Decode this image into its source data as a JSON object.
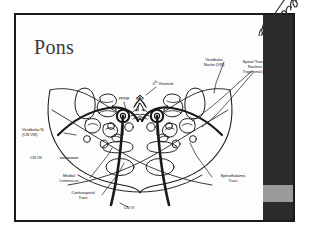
{
  "slide": {
    "title": "Pons",
    "watermark": "handwritten-signature"
  },
  "colors": {
    "frame_border": "#1a1a1a",
    "bar_dark": "#2b2b2b",
    "bar_gray": "#9a9a9a",
    "slide_background": "#fdfdfd",
    "title_text": "#3a3a3a",
    "label_text": "#111111",
    "line_stroke": "#1a1a1a"
  },
  "labels": {
    "vestibular_nuclei_viii": "Vestibular\nNuclei (VIII)",
    "vestibular_nuclei_viii_l1": "Vestibular",
    "vestibular_nuclei_viii_l2": "Nuclei (VIII)",
    "spinal_tract_nucleus_trigeminal_l1": "Spinal Tract &",
    "spinal_tract_nucleus_trigeminal_l2": "Nucleus",
    "spinal_tract_nucleus_trigeminal_l3": "Trigeminal (V)",
    "fourth_ventricle": "4th Ventricle",
    "fourth_ventricle_num": "4",
    "fourth_ventricle_sup": "th",
    "fourth_ventricle_rest": " Ventricle",
    "pprf": "PPRF",
    "mlf": "MLF",
    "vestibular_n_l1": "Vestibular N.",
    "vestibular_n_l2": "(CN VIII)",
    "cn_vii": "CN VII",
    "medial_lemniscus_l1": "Medial",
    "medial_lemniscus_l2": "Lemniscus",
    "corticospinal_tract_l1": "Corticospinal",
    "corticospinal_tract_l2": "Tract",
    "cn_vi": "CN VI",
    "spinothalamic_tract_l1": "Spinothalamic",
    "spinothalamic_tract_l2": "Tract"
  }
}
